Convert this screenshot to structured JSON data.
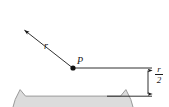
{
  "figure": {
    "type": "geometry-diagram",
    "background_color": "#ffffff",
    "fill_color": "#dcdcdc",
    "outline_color": "#9a9a9a",
    "line_color": "#1a1a1a",
    "labels": {
      "radius": "r",
      "point": "P",
      "offset_numerator": "r",
      "offset_denominator": "2"
    },
    "shape": {
      "name": "circular-segment",
      "center_x": 73,
      "center_y": 56,
      "radius": 62,
      "chord_y": 96
    },
    "dimension_line": {
      "name": "r-over-2-dimension",
      "x": 148,
      "y_top": 68,
      "y_bottom": 96
    },
    "horizontal_leader": {
      "from_x": 73,
      "to_x": 152,
      "y": 68
    },
    "baseline": {
      "from_x": 108,
      "to_x": 152,
      "y": 96
    },
    "radius_arrow": {
      "from_x": 73,
      "from_y": 68,
      "to_x": 22,
      "to_y": 28
    }
  }
}
